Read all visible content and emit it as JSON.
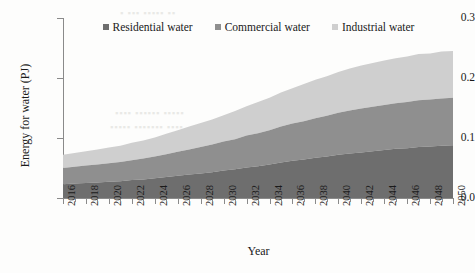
{
  "figure": {
    "background": "#fdfdfc",
    "caption_partial": ""
  },
  "legend": {
    "position": "top-center",
    "items": [
      {
        "label": "Residential water",
        "color": "#6e6e6e",
        "marker": "square-marker"
      },
      {
        "label": "Commercial water",
        "color": "#8f8f8f",
        "marker": "square-marker"
      },
      {
        "label": "Industrial water",
        "color": "#cfcfcf",
        "marker": "square-marker"
      }
    ]
  },
  "axes": {
    "x_title": "Year",
    "y_title": "Energy for water (PJ)",
    "y_ticks": [
      "0.0",
      "0.1",
      "0.2",
      "0.3"
    ],
    "x_ticks": [
      "2016",
      "2018",
      "2020",
      "2022",
      "2024",
      "2026",
      "2028",
      "2030",
      "2032",
      "2034",
      "2036",
      "2038",
      "2040",
      "2042",
      "2044",
      "2046",
      "2048",
      "2050"
    ]
  },
  "chart_data": {
    "type": "area",
    "stacked": true,
    "title": "",
    "xlabel": "Year",
    "ylabel": "Energy for water (PJ)",
    "xlim": [
      2016,
      2050
    ],
    "ylim": [
      0.0,
      0.3
    ],
    "ytick_values": [
      0.0,
      0.1,
      0.2,
      0.3
    ],
    "grid": false,
    "legend_position": "top-center",
    "x": [
      2016,
      2017,
      2018,
      2019,
      2020,
      2021,
      2022,
      2023,
      2024,
      2025,
      2026,
      2027,
      2028,
      2029,
      2030,
      2031,
      2032,
      2033,
      2034,
      2035,
      2036,
      2037,
      2038,
      2039,
      2040,
      2041,
      2042,
      2043,
      2044,
      2045,
      2046,
      2047,
      2048,
      2049,
      2050
    ],
    "series": [
      {
        "name": "Residential water",
        "color": "#6e6e6e",
        "values": [
          0.023,
          0.024,
          0.025,
          0.026,
          0.027,
          0.028,
          0.03,
          0.031,
          0.033,
          0.035,
          0.037,
          0.039,
          0.041,
          0.043,
          0.046,
          0.048,
          0.051,
          0.053,
          0.056,
          0.059,
          0.062,
          0.064,
          0.067,
          0.069,
          0.072,
          0.074,
          0.076,
          0.078,
          0.08,
          0.082,
          0.083,
          0.085,
          0.086,
          0.087,
          0.088
        ]
      },
      {
        "name": "Commercial water",
        "color": "#8f8f8f",
        "values": [
          0.027,
          0.028,
          0.029,
          0.03,
          0.031,
          0.032,
          0.033,
          0.035,
          0.036,
          0.038,
          0.04,
          0.042,
          0.044,
          0.046,
          0.048,
          0.05,
          0.053,
          0.055,
          0.057,
          0.06,
          0.062,
          0.064,
          0.066,
          0.068,
          0.07,
          0.072,
          0.073,
          0.074,
          0.075,
          0.076,
          0.077,
          0.078,
          0.078,
          0.079,
          0.079
        ]
      },
      {
        "name": "Industrial water",
        "color": "#cfcfcf",
        "values": [
          0.022,
          0.023,
          0.024,
          0.025,
          0.026,
          0.027,
          0.029,
          0.03,
          0.032,
          0.034,
          0.036,
          0.038,
          0.04,
          0.042,
          0.044,
          0.047,
          0.049,
          0.052,
          0.054,
          0.057,
          0.059,
          0.062,
          0.064,
          0.066,
          0.068,
          0.07,
          0.072,
          0.073,
          0.074,
          0.075,
          0.076,
          0.077,
          0.077,
          0.078,
          0.078
        ]
      }
    ],
    "totals": [
      0.072,
      0.075,
      0.078,
      0.081,
      0.084,
      0.087,
      0.092,
      0.096,
      0.101,
      0.107,
      0.113,
      0.119,
      0.125,
      0.131,
      0.138,
      0.145,
      0.153,
      0.16,
      0.167,
      0.176,
      0.183,
      0.19,
      0.197,
      0.203,
      0.21,
      0.216,
      0.221,
      0.225,
      0.229,
      0.233,
      0.236,
      0.24,
      0.241,
      0.244,
      0.245
    ]
  }
}
